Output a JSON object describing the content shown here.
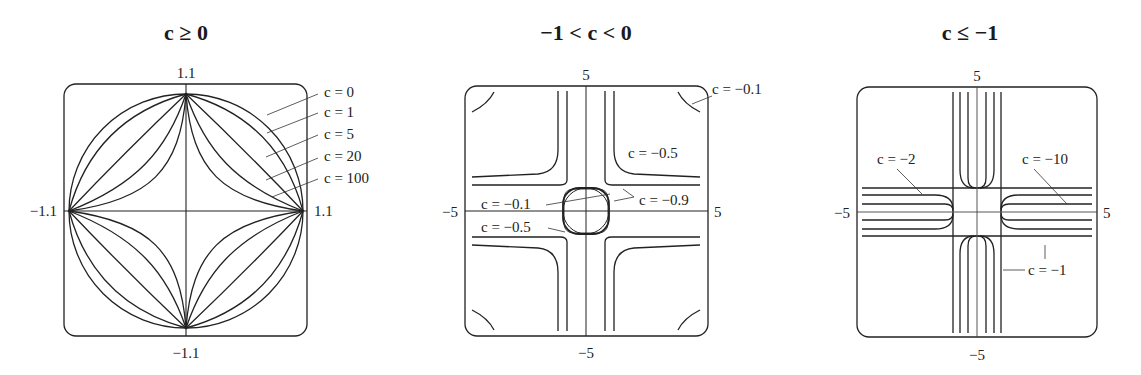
{
  "figure": {
    "panels": [
      {
        "title": "c ≥ 0",
        "ticks": {
          "top": "1.1",
          "bottom": "−1.1",
          "left": "−1.1",
          "right": "1.1"
        },
        "labels": [
          "c = 0",
          "c = 1",
          "c = 5",
          "c = 20",
          "c = 100"
        ]
      },
      {
        "title": "−1 < c < 0",
        "ticks": {
          "top": "5",
          "bottom": "−5",
          "left": "−5",
          "right": "5"
        },
        "labels": [
          "c = −0.1",
          "c = −0.5",
          "c = −0.1",
          "c = −0.9",
          "c = −0.5"
        ]
      },
      {
        "title": "c ≤ −1",
        "ticks": {
          "top": "5",
          "bottom": "−5",
          "left": "−5",
          "right": "5"
        },
        "labels": [
          "c = −2",
          "c = −10",
          "c = −1"
        ]
      }
    ]
  }
}
